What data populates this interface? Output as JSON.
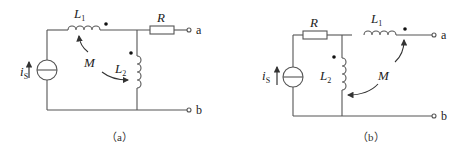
{
  "figures": [
    {
      "id": "a",
      "caption": "（a）",
      "labels": {
        "source": "i",
        "source_sub": "S",
        "L1": "L",
        "L1_sub": "1",
        "L2": "L",
        "L2_sub": "2",
        "R": "R",
        "M": "M",
        "terminal_a": "a",
        "terminal_b": "b"
      }
    },
    {
      "id": "b",
      "caption": "（b）",
      "labels": {
        "source": "i",
        "source_sub": "S",
        "L1": "L",
        "L1_sub": "1",
        "L2": "L",
        "L2_sub": "2",
        "R": "R",
        "M": "M",
        "terminal_a": "a",
        "terminal_b": "b"
      }
    }
  ],
  "colors": {
    "wire": "#555555",
    "text": "#222222",
    "background": "#ffffff"
  }
}
